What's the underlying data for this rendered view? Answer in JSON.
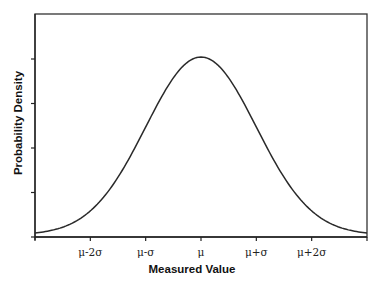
{
  "chart_data": {
    "type": "line",
    "title": "",
    "xlabel": "Measured Value",
    "ylabel": "Probability Density",
    "distribution": "normal",
    "x_tick_labels": [
      "",
      "μ-2σ",
      "μ-σ",
      "μ",
      "μ+σ",
      "μ+2σ",
      ""
    ],
    "x_tick_positions_sigma": [
      -3,
      -2,
      -1,
      0,
      1,
      2,
      3
    ],
    "xlim_sigma": [
      -3,
      3
    ],
    "y_tick_count": 5,
    "y_tick_labels": [
      "",
      "",
      "",
      "",
      ""
    ],
    "ylim_relative": [
      0,
      1.2
    ],
    "series": [
      {
        "name": "Normal distribution",
        "x_sigma": [
          -3,
          -2.5,
          -2,
          -1.5,
          -1,
          -0.5,
          0,
          0.5,
          1,
          1.5,
          2,
          2.5,
          3
        ],
        "y_relative": [
          0.011,
          0.044,
          0.135,
          0.325,
          0.607,
          0.882,
          1.0,
          0.882,
          0.607,
          0.325,
          0.135,
          0.044,
          0.011
        ]
      }
    ],
    "grid": false,
    "legend": null,
    "frame": "box"
  },
  "labels": {
    "x_title": "Measured Value",
    "y_title": "Probability Density",
    "x_ticks": [
      "μ-2σ",
      "μ-σ",
      "μ",
      "μ+σ",
      "μ+2σ"
    ]
  }
}
